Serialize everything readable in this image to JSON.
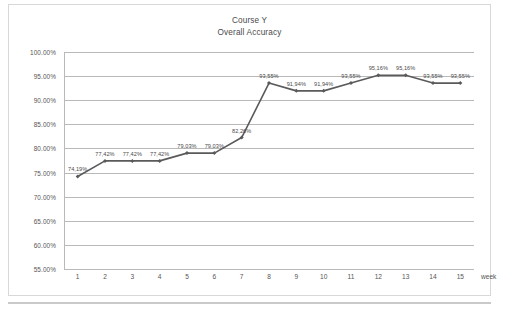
{
  "chart_data": {
    "type": "line",
    "title": "Course Y",
    "subtitle": "Overall Accuracy",
    "xlabel": "week",
    "ylabel": "",
    "categories": [
      1,
      2,
      3,
      4,
      5,
      6,
      7,
      8,
      9,
      10,
      11,
      12,
      13,
      14,
      15
    ],
    "x_tick_labels": [
      "1",
      "2",
      "3",
      "4",
      "5",
      "6",
      "7",
      "8",
      "9",
      "10",
      "11",
      "12",
      "13",
      "14",
      "15"
    ],
    "values": [
      74.19,
      77.42,
      77.42,
      77.42,
      79.03,
      79.03,
      82.26,
      93.55,
      91.94,
      91.94,
      93.55,
      95.16,
      95.16,
      93.55,
      93.55
    ],
    "point_labels": [
      "74,19%",
      "77,42%",
      "77,42%",
      "77,42%",
      "79,03%",
      "79,03%",
      "82,26%",
      "93,55%",
      "91,94%",
      "91,94%",
      "93,55%",
      "95,16%",
      "95,16%",
      "93,55%",
      "93,55%"
    ],
    "ylim": [
      55,
      100
    ],
    "y_ticks": [
      55,
      60,
      65,
      70,
      75,
      80,
      85,
      90,
      95,
      100
    ],
    "y_tick_labels": [
      "55.00%",
      "60.00%",
      "65.00%",
      "70.00%",
      "75.00%",
      "80.00%",
      "85.00%",
      "90.00%",
      "95.00%",
      "100.00%"
    ],
    "grid": "horizontal",
    "legend": "none",
    "series_color": "#5a5a5a",
    "marker": "diamond",
    "grid_color": "#b9b9b9"
  }
}
